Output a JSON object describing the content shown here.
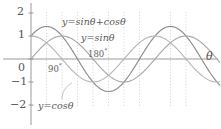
{
  "chart_data": {
    "type": "line",
    "title": "",
    "xlabel": "θ",
    "ylabel": "",
    "xlim": [
      -20,
      610
    ],
    "ylim": [
      -2.3,
      2.3
    ],
    "grid": false,
    "legend_position": "inline-annotations",
    "y_ticks": [
      {
        "value": 2,
        "label": "2"
      },
      {
        "value": 1,
        "label": "1"
      },
      {
        "value": 0,
        "label": "0"
      },
      {
        "value": -1,
        "label": "−1"
      },
      {
        "value": -2,
        "label": "−2"
      }
    ],
    "x_annotations": [
      {
        "value": 90,
        "label": "90",
        "unit": "°"
      },
      {
        "value": 180,
        "label": "180",
        "unit": "°"
      }
    ],
    "series": [
      {
        "name": "y=sinθ+cosθ",
        "label": "y=sinθ+cosθ",
        "color": "#8c8c8c",
        "amplitude": 1.4142,
        "phase_deg": 45,
        "key_points": [
          {
            "x": 0,
            "y": 1.0
          },
          {
            "x": 45,
            "y": 1.414
          },
          {
            "x": 135,
            "y": 0.0
          },
          {
            "x": 225,
            "y": -1.414
          },
          {
            "x": 315,
            "y": 0.0
          },
          {
            "x": 405,
            "y": 1.414
          },
          {
            "x": 495,
            "y": 0.0
          },
          {
            "x": 585,
            "y": -1.414
          }
        ]
      },
      {
        "name": "y=sinθ",
        "label": "y=sinθ",
        "color": "#a8a8a8",
        "amplitude": 1.0,
        "phase_deg": 0,
        "key_points": [
          {
            "x": 0,
            "y": 0.0
          },
          {
            "x": 90,
            "y": 1.0
          },
          {
            "x": 180,
            "y": 0.0
          },
          {
            "x": 270,
            "y": -1.0
          },
          {
            "x": 360,
            "y": 0.0
          },
          {
            "x": 450,
            "y": 1.0
          },
          {
            "x": 540,
            "y": 0.0
          }
        ]
      },
      {
        "name": "y=cosθ",
        "label": "y=cosθ",
        "color": "#b8b8b8",
        "amplitude": 1.0,
        "phase_deg": 90,
        "key_points": [
          {
            "x": 0,
            "y": 1.0
          },
          {
            "x": 90,
            "y": 0.0
          },
          {
            "x": 180,
            "y": -1.0
          },
          {
            "x": 270,
            "y": 0.0
          },
          {
            "x": 360,
            "y": 1.0
          },
          {
            "x": 450,
            "y": 0.0
          },
          {
            "x": 540,
            "y": -1.0
          }
        ]
      }
    ],
    "guide_lines": {
      "color": "#c9c9c9",
      "style": "dotted",
      "x_positions_deg": [
        45,
        90,
        135,
        180,
        225,
        270,
        315,
        405,
        450
      ]
    },
    "axis_color": "#8f8f8f"
  },
  "labels": {
    "y_2": "2",
    "y_1": "1",
    "y_0": "0",
    "y_m1": "−1",
    "y_m2": "−2",
    "theta_axis": "θ",
    "deg90": "90",
    "deg180": "180",
    "degree_symbol": "°",
    "eq_sum": "y=sinθ+cosθ",
    "eq_sin": "y=sinθ",
    "eq_cos": "y=cosθ"
  }
}
